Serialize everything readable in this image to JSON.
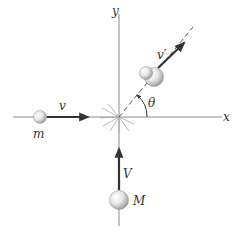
{
  "diagram": {
    "type": "collision-diagram",
    "axes": {
      "x_label": "x",
      "y_label": "y"
    },
    "particles": [
      {
        "name": "small-mass",
        "label": "m",
        "velocity_label": "v",
        "direction": "+x"
      },
      {
        "name": "large-mass",
        "label": "M",
        "velocity_label": "V",
        "direction": "+y"
      },
      {
        "name": "combined-mass",
        "velocity_label": "v′",
        "direction": "angle theta above +x"
      }
    ],
    "angle_label": "θ",
    "colors": {
      "axis": "#8a8a8a",
      "arrow": "#333333",
      "ball_highlight": "#ffffff",
      "ball_shade": "#9a9a9a",
      "text": "#333333"
    }
  }
}
